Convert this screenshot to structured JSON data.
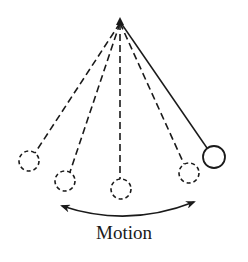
{
  "diagram": {
    "caption": "Motion",
    "colors": {
      "stroke": "#1a1a1a",
      "background": "#ffffff"
    },
    "pivot": {
      "x": 120,
      "y": 22
    },
    "positions": [
      {
        "name": "far-left",
        "x": 29,
        "y": 161,
        "r": 10,
        "style": "dashed"
      },
      {
        "name": "left",
        "x": 65,
        "y": 181,
        "r": 10,
        "style": "dashed"
      },
      {
        "name": "center",
        "x": 121,
        "y": 189,
        "r": 10,
        "style": "dashed"
      },
      {
        "name": "right",
        "x": 189,
        "y": 173,
        "r": 10,
        "style": "dashed"
      },
      {
        "name": "current",
        "x": 214,
        "y": 157,
        "r": 11,
        "style": "solid"
      }
    ],
    "arrow": {
      "type": "double-headed-arc",
      "from": [
        62,
        205
      ],
      "to": [
        194,
        203
      ]
    }
  }
}
